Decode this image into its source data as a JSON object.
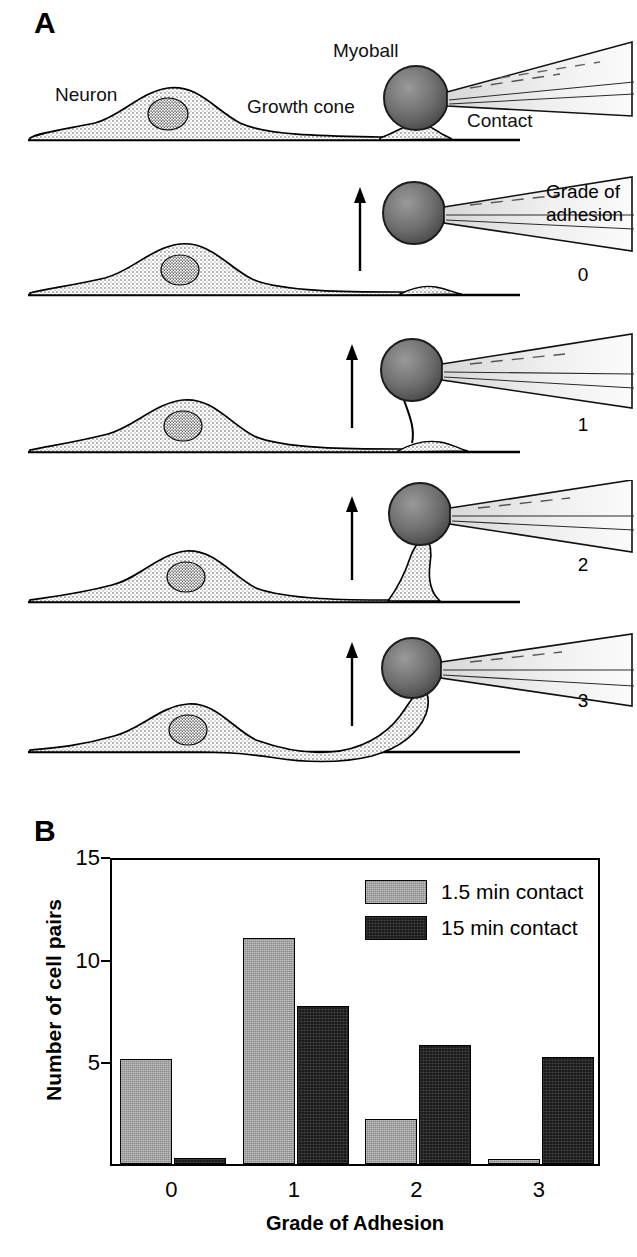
{
  "figure": {
    "panel_a_letter": "A",
    "panel_b_letter": "B"
  },
  "panel_a": {
    "labels": {
      "neuron": "Neuron",
      "growth_cone": "Growth cone",
      "myoball": "Myoball",
      "contact": "Contact",
      "grade_heading_line1": "Grade of",
      "grade_heading_line2": "adhesion"
    },
    "rows": [
      {
        "grade": "",
        "description": "Neuron with growth cone contacting myoball held by suction pipette"
      },
      {
        "grade": "0",
        "description": "Myoball pulled away; no adhesion, growth cone unchanged"
      },
      {
        "grade": "1",
        "description": "Thin tether drawn from growth cone to myoball"
      },
      {
        "grade": "2",
        "description": "Thick cone of membrane drawn up from growth cone"
      },
      {
        "grade": "3",
        "description": "Neurite lifted off substrate along with myoball"
      }
    ]
  },
  "chart_data": {
    "type": "bar",
    "title": "",
    "xlabel": "Grade of Adhesion",
    "ylabel": "Number of cell pairs",
    "categories": [
      "0",
      "1",
      "2",
      "3"
    ],
    "yticks": [
      5,
      10,
      15
    ],
    "ylim": [
      0,
      15
    ],
    "grid": false,
    "legend_position": "top-right",
    "series": [
      {
        "name": "1.5 min contact",
        "color": "#8a8a8a",
        "values": [
          5.1,
          11.0,
          2.2,
          0.2
        ]
      },
      {
        "name": "15 min contact",
        "color": "#1b1b1b",
        "values": [
          0.3,
          7.7,
          5.8,
          5.2
        ]
      }
    ]
  }
}
